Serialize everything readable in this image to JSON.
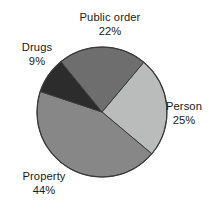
{
  "chart_data": {
    "type": "pie",
    "title": "",
    "subtitle": "",
    "xlabel": "",
    "ylabel": "",
    "grid": false,
    "legend": "none",
    "labels_position": "outside",
    "units": "percent",
    "total": 100,
    "center": {
      "x": 102,
      "y": 112,
      "radius": 65
    },
    "start_angle_deg": 40,
    "direction": "clockwise",
    "categories": [
      "Person",
      "Property",
      "Drugs",
      "Public order"
    ],
    "values": [
      25,
      44,
      9,
      22
    ],
    "colors": [
      "#b9bcba",
      "#878787",
      "#2c2c2c",
      "#6e6e6e"
    ],
    "slices": [
      {
        "label": "Person",
        "value": 25,
        "value_text": "25%",
        "color": "#b9bcba",
        "start_deg": 40,
        "sweep_deg": 90,
        "label_x": 155,
        "label_y": 100
      },
      {
        "label": "Property",
        "value": 44,
        "value_text": "44%",
        "color": "#878787",
        "start_deg": 130,
        "sweep_deg": 158.4,
        "label_x": 6,
        "label_y": 170
      },
      {
        "label": "Drugs",
        "value": 9,
        "value_text": "9%",
        "color": "#2c2c2c",
        "start_deg": 288.4,
        "sweep_deg": 32.4,
        "label_x": 6,
        "label_y": 41
      },
      {
        "label": "Public order",
        "value": 22,
        "value_text": "22%",
        "color": "#6e6e6e",
        "start_deg": 320.8,
        "sweep_deg": 79.2,
        "label_x": 58,
        "label_y": 11
      }
    ],
    "outline_color": "#3a3a3a",
    "background": "#ffffff"
  },
  "labels": {
    "public_order": {
      "name": "Public order",
      "pct": "22%"
    },
    "drugs": {
      "name": "Drugs",
      "pct": "9%"
    },
    "person": {
      "name": "Person",
      "pct": "25%"
    },
    "property": {
      "name": "Property",
      "pct": "44%"
    }
  }
}
